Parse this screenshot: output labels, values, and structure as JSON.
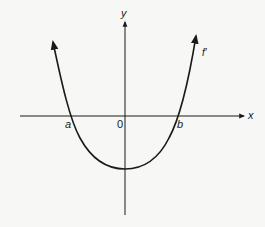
{
  "diagram": {
    "type": "function-graph",
    "curve_label": "f′",
    "axes": {
      "x_label": "x",
      "y_label": "y",
      "origin_label": "0"
    },
    "roots": [
      {
        "label": "a"
      },
      {
        "label": "b"
      }
    ]
  },
  "colors": {
    "line": "#1a1a1a",
    "background": "#f7f7f5"
  }
}
